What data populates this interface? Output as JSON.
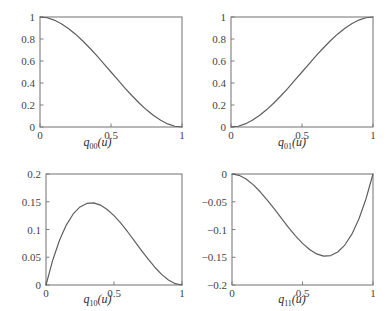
{
  "figure": {
    "background_color": "#ffffff",
    "axis_color": "#7d7d7d",
    "curve_color": "#5c5c5c"
  },
  "panels": [
    {
      "id": "q00",
      "label_base": "q",
      "label_sub": "00",
      "label_arg": "(u)",
      "label_full": "q00(u)"
    },
    {
      "id": "q01",
      "label_base": "q",
      "label_sub": "01",
      "label_arg": "(u)",
      "label_full": "q01(u)"
    },
    {
      "id": "q10",
      "label_base": "q",
      "label_sub": "10",
      "label_arg": "(u)",
      "label_full": "q10(u)"
    },
    {
      "id": "q11",
      "label_base": "q",
      "label_sub": "11",
      "label_arg": "(u)",
      "label_full": "q11(u)"
    }
  ],
  "chart_data": [
    {
      "type": "line",
      "id": "q00",
      "title": "",
      "xlabel": "q00(u)",
      "ylabel": "",
      "xlim": [
        0,
        1
      ],
      "ylim": [
        0,
        1
      ],
      "xticks": [
        0,
        0.5,
        1
      ],
      "xticklabels": [
        "0",
        "0.5",
        "1"
      ],
      "yticks": [
        0,
        0.2,
        0.4,
        0.6,
        0.8,
        1
      ],
      "yticklabels": [
        "0",
        "0.2",
        "0.4",
        "0.6",
        "0.8",
        "1"
      ],
      "grid": false,
      "legend": null,
      "expression": "2u^3 - 3u^2 + 1",
      "x": [
        0,
        0.05,
        0.1,
        0.15,
        0.2,
        0.25,
        0.3,
        0.35,
        0.4,
        0.45,
        0.5,
        0.55,
        0.6,
        0.65,
        0.7,
        0.75,
        0.8,
        0.85,
        0.9,
        0.95,
        1
      ],
      "y": [
        1,
        0.9928,
        0.972,
        0.9393,
        0.896,
        0.8438,
        0.784,
        0.7183,
        0.648,
        0.5748,
        0.5,
        0.4253,
        0.352,
        0.2818,
        0.216,
        0.1563,
        0.104,
        0.0608,
        0.028,
        0.0073,
        0
      ]
    },
    {
      "type": "line",
      "id": "q01",
      "title": "",
      "xlabel": "q01(u)",
      "ylabel": "",
      "xlim": [
        0,
        1
      ],
      "ylim": [
        0,
        1
      ],
      "xticks": [
        0,
        0.5,
        1
      ],
      "xticklabels": [
        "0",
        "0.5",
        "1"
      ],
      "yticks": [
        0,
        0.2,
        0.4,
        0.6,
        0.8,
        1
      ],
      "yticklabels": [
        "0",
        "0.2",
        "0.4",
        "0.6",
        "0.8",
        "1"
      ],
      "grid": false,
      "legend": null,
      "expression": "-2u^3 + 3u^2",
      "x": [
        0,
        0.05,
        0.1,
        0.15,
        0.2,
        0.25,
        0.3,
        0.35,
        0.4,
        0.45,
        0.5,
        0.55,
        0.6,
        0.65,
        0.7,
        0.75,
        0.8,
        0.85,
        0.9,
        0.95,
        1
      ],
      "y": [
        0,
        0.0073,
        0.028,
        0.0608,
        0.104,
        0.1563,
        0.216,
        0.2818,
        0.352,
        0.4253,
        0.5,
        0.5748,
        0.648,
        0.7183,
        0.784,
        0.8438,
        0.896,
        0.9393,
        0.972,
        0.9928,
        1
      ]
    },
    {
      "type": "line",
      "id": "q10",
      "title": "",
      "xlabel": "q10(u)",
      "ylabel": "",
      "xlim": [
        0,
        1
      ],
      "ylim": [
        0,
        0.2
      ],
      "xticks": [
        0,
        0.5,
        1
      ],
      "xticklabels": [
        "0",
        "0.5",
        "1"
      ],
      "yticks": [
        0,
        0.05,
        0.1,
        0.15,
        0.2
      ],
      "yticklabels": [
        "0",
        "0.05",
        "0.1",
        "0.15",
        "0.2"
      ],
      "grid": false,
      "legend": null,
      "expression": "u^3 - 2u^2 + u",
      "peak": {
        "x": 0.3333,
        "y": 0.1481
      },
      "x": [
        0,
        0.05,
        0.1,
        0.15,
        0.2,
        0.25,
        0.3,
        0.35,
        0.4,
        0.45,
        0.5,
        0.55,
        0.6,
        0.65,
        0.7,
        0.75,
        0.8,
        0.85,
        0.9,
        0.95,
        1
      ],
      "y": [
        0,
        0.0451,
        0.081,
        0.1084,
        0.128,
        0.1406,
        0.147,
        0.1479,
        0.144,
        0.1361,
        0.125,
        0.1114,
        0.096,
        0.0796,
        0.063,
        0.0469,
        0.032,
        0.0191,
        0.009,
        0.0024,
        0
      ]
    },
    {
      "type": "line",
      "id": "q11",
      "title": "",
      "xlabel": "q11(u)",
      "ylabel": "",
      "xlim": [
        0,
        1
      ],
      "ylim": [
        -0.2,
        0
      ],
      "xticks": [
        0,
        0.5,
        1
      ],
      "xticklabels": [
        "0",
        "0.5",
        "1"
      ],
      "yticks": [
        0,
        -0.05,
        -0.1,
        -0.15,
        -0.2
      ],
      "yticklabels": [
        "0",
        "−0.05",
        "−0.1",
        "−0.15",
        "−0.2"
      ],
      "grid": false,
      "legend": null,
      "expression": "u^3 - u^2",
      "minimum": {
        "x": 0.6667,
        "y": -0.1481
      },
      "x": [
        0,
        0.05,
        0.1,
        0.15,
        0.2,
        0.25,
        0.3,
        0.35,
        0.4,
        0.45,
        0.5,
        0.55,
        0.6,
        0.65,
        0.7,
        0.75,
        0.8,
        0.85,
        0.9,
        0.95,
        1
      ],
      "y": [
        0,
        -0.0024,
        -0.009,
        -0.0191,
        -0.032,
        -0.0469,
        -0.063,
        -0.0796,
        -0.096,
        -0.1114,
        -0.125,
        -0.1361,
        -0.144,
        -0.1479,
        -0.147,
        -0.1406,
        -0.128,
        -0.1084,
        -0.081,
        -0.0451,
        0
      ]
    }
  ]
}
